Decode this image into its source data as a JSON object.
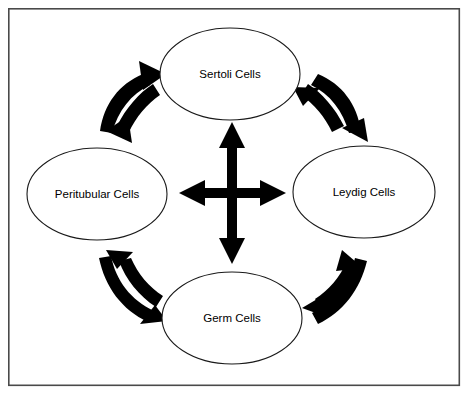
{
  "diagram": {
    "background_color": "#ffffff",
    "frame": {
      "name": "outer-border",
      "stroke_color": "#4a4a4a",
      "x": 8,
      "y": 8,
      "width": 452,
      "height": 378
    },
    "nodes": [
      {
        "id": "sertoli",
        "label": "Sertoli Cells",
        "position": "top",
        "cx": 230,
        "cy": 74,
        "rx": 70,
        "ry": 46,
        "fill": "#ffffff",
        "stroke": "#1a1a1a"
      },
      {
        "id": "peritubular",
        "label": "Peritubular Cells",
        "position": "left",
        "cx": 97,
        "cy": 194,
        "rx": 70,
        "ry": 46,
        "fill": "#ffffff",
        "stroke": "#1a1a1a"
      },
      {
        "id": "leydig",
        "label": "Leydig Cells",
        "position": "right",
        "cx": 364,
        "cy": 192,
        "rx": 71,
        "ry": 46,
        "fill": "#ffffff",
        "stroke": "#1a1a1a"
      },
      {
        "id": "germ",
        "label": "Germ Cells",
        "position": "bottom",
        "cx": 232,
        "cy": 318,
        "rx": 70,
        "ry": 46,
        "fill": "#ffffff",
        "stroke": "#1a1a1a"
      }
    ],
    "center_connector": {
      "name": "four-way-cross-arrow",
      "kind": "bidirectional-cross",
      "color": "#000000",
      "center_x": 232,
      "center_y": 193,
      "horizontal_span": [
        180,
        285
      ],
      "vertical_span": [
        124,
        262
      ],
      "connects": [
        "sertoli",
        "peritubular",
        "leydig",
        "germ"
      ]
    },
    "curved_connectors": [
      {
        "id": "sertoli-peritubular",
        "name": "curved-arrow-pair-sertoli-peritubular",
        "from": "Peritubular Cells",
        "to": "Sertoli Cells",
        "bidirectional": true,
        "color": "#000000",
        "quadrant": "top-left"
      },
      {
        "id": "sertoli-leydig",
        "name": "curved-arrow-pair-sertoli-leydig",
        "from": "Sertoli Cells",
        "to": "Leydig Cells",
        "bidirectional": true,
        "color": "#000000",
        "quadrant": "top-right"
      },
      {
        "id": "peritubular-germ",
        "name": "curved-arrow-pair-peritubular-germ",
        "from": "Peritubular Cells",
        "to": "Germ Cells",
        "bidirectional": true,
        "color": "#000000",
        "quadrant": "bottom-left"
      },
      {
        "id": "leydig-germ",
        "name": "curved-arrow-pair-leydig-germ",
        "from": "Germ Cells",
        "to": "Leydig Cells",
        "bidirectional": true,
        "color": "#000000",
        "quadrant": "bottom-right"
      }
    ]
  }
}
